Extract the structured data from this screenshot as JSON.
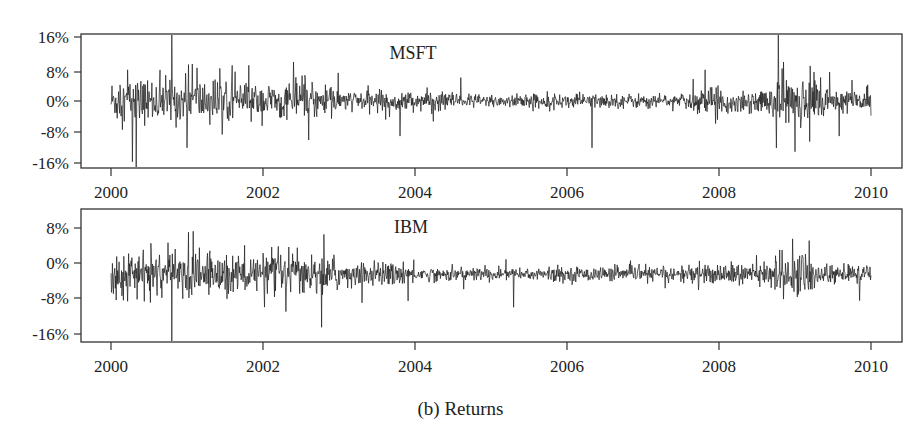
{
  "caption": "(b)  Returns",
  "chart_data": [
    {
      "type": "line",
      "title": "MSFT",
      "xlabel": "",
      "ylabel": "",
      "x_ticks": [
        "2000",
        "2002",
        "2004",
        "2006",
        "2008",
        "2010"
      ],
      "y_ticks": [
        "16%",
        "8%",
        "0%",
        "-8%",
        "-16%"
      ],
      "y_tick_values": [
        16,
        8,
        0,
        -8,
        -16
      ],
      "xlim": [
        1999.6,
        2010.4
      ],
      "ylim": [
        -17.5,
        17.5
      ],
      "grid": false,
      "series": [
        {
          "name": "MSFT daily returns (%)",
          "start": 2000.0,
          "end": 2010.0,
          "baseline": 0,
          "volatility_regimes": [
            {
              "from": 2000.0,
              "to": 2001.5,
              "sigma": 2.8
            },
            {
              "from": 2001.5,
              "to": 2003.0,
              "sigma": 2.2
            },
            {
              "from": 2003.0,
              "to": 2004.5,
              "sigma": 1.3
            },
            {
              "from": 2004.5,
              "to": 2007.6,
              "sigma": 0.9
            },
            {
              "from": 2007.6,
              "to": 2008.7,
              "sigma": 1.6
            },
            {
              "from": 2008.7,
              "to": 2009.4,
              "sigma": 3.2
            },
            {
              "from": 2009.4,
              "to": 2010.0,
              "sigma": 1.6
            }
          ],
          "spikes": [
            {
              "t": 2000.28,
              "v": -15.6
            },
            {
              "t": 2000.33,
              "v": -17.0
            },
            {
              "t": 2000.22,
              "v": 8.0
            },
            {
              "t": 2000.8,
              "v": 17.5
            },
            {
              "t": 2001.0,
              "v": -12.0
            },
            {
              "t": 2001.07,
              "v": 9.5
            },
            {
              "t": 2001.13,
              "v": 8.5
            },
            {
              "t": 2002.4,
              "v": 10.0
            },
            {
              "t": 2002.6,
              "v": -10.0
            },
            {
              "t": 2003.8,
              "v": -9.0
            },
            {
              "t": 2004.6,
              "v": 6.0
            },
            {
              "t": 2006.33,
              "v": -12.0
            },
            {
              "t": 2007.82,
              "v": 8.0
            },
            {
              "t": 2008.78,
              "v": 17.5
            },
            {
              "t": 2008.85,
              "v": 10.0
            },
            {
              "t": 2009.0,
              "v": -13.0
            },
            {
              "t": 2009.2,
              "v": 9.0
            },
            {
              "t": 2009.58,
              "v": -9.0
            }
          ]
        }
      ]
    },
    {
      "type": "line",
      "title": "IBM",
      "xlabel": "",
      "ylabel": "",
      "x_ticks": [
        "2000",
        "2002",
        "2004",
        "2006",
        "2008",
        "2010"
      ],
      "y_ticks": [
        "8%",
        "0%",
        "-8%",
        "-16%"
      ],
      "y_tick_values": [
        8,
        0,
        -8,
        -16
      ],
      "xlim": [
        1999.6,
        2010.4
      ],
      "ylim": [
        -18.0,
        10.5
      ],
      "grid": false,
      "series": [
        {
          "name": "IBM daily returns (%)",
          "start": 2000.0,
          "end": 2010.0,
          "baseline": -2.5,
          "volatility_regimes": [
            {
              "from": 2000.0,
              "to": 2001.6,
              "sigma": 2.4
            },
            {
              "from": 2001.6,
              "to": 2003.0,
              "sigma": 2.2
            },
            {
              "from": 2003.0,
              "to": 2004.0,
              "sigma": 1.3
            },
            {
              "from": 2004.0,
              "to": 2007.5,
              "sigma": 0.8
            },
            {
              "from": 2007.5,
              "to": 2008.7,
              "sigma": 1.2
            },
            {
              "from": 2008.7,
              "to": 2009.3,
              "sigma": 2.3
            },
            {
              "from": 2009.3,
              "to": 2010.0,
              "sigma": 1.1
            }
          ],
          "spikes": [
            {
              "t": 2000.8,
              "v": -18.0
            },
            {
              "t": 2001.02,
              "v": 7.0
            },
            {
              "t": 2001.08,
              "v": 7.2
            },
            {
              "t": 2002.3,
              "v": -11.0
            },
            {
              "t": 2002.8,
              "v": 6.5
            },
            {
              "t": 2002.45,
              "v": 3.5
            },
            {
              "t": 2003.3,
              "v": -9.0
            },
            {
              "t": 2005.3,
              "v": -10.0
            },
            {
              "t": 2008.8,
              "v": 3.0
            },
            {
              "t": 2008.97,
              "v": 5.5
            },
            {
              "t": 2009.1,
              "v": 1.5
            },
            {
              "t": 2009.85,
              "v": -8.5
            }
          ]
        }
      ]
    }
  ]
}
